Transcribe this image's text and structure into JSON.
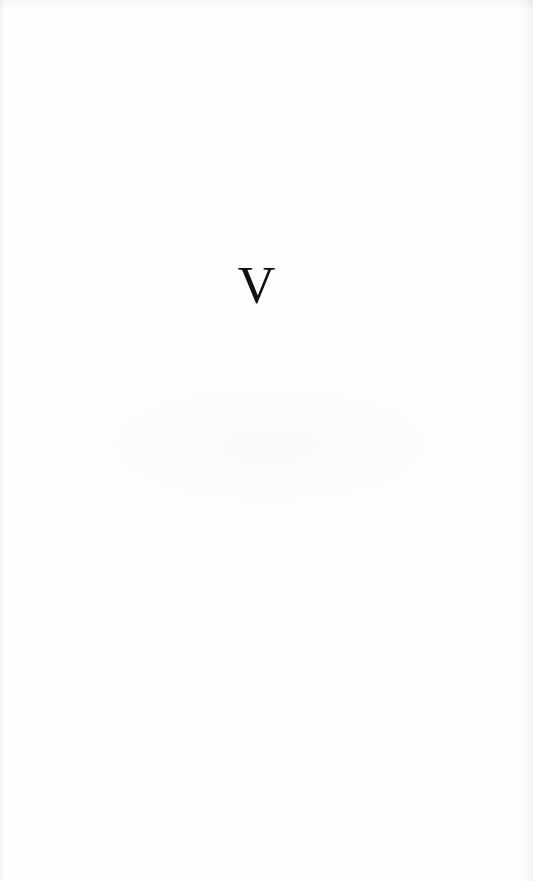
{
  "page": {
    "heading_numeral": "V"
  },
  "colors": {
    "paper": "#fefefe",
    "ink": "#111111"
  }
}
